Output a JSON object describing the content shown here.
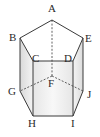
{
  "figure": {
    "type": "pentagonal-prism",
    "vertices": {
      "A": {
        "label": "A",
        "x": 52,
        "y": 20,
        "lx": 51,
        "ly": 14
      },
      "B": {
        "label": "B",
        "x": 20,
        "y": 38,
        "lx": 10,
        "ly": 42
      },
      "C": {
        "label": "C",
        "x": 33,
        "y": 61,
        "lx": 32,
        "ly": 58
      },
      "D": {
        "label": "D",
        "x": 73,
        "y": 61,
        "lx": 64,
        "ly": 58
      },
      "E": {
        "label": "E",
        "x": 83,
        "y": 38,
        "lx": 85,
        "ly": 42
      },
      "F": {
        "label": "F",
        "x": 52,
        "y": 76,
        "lx": 49,
        "ly": 87
      },
      "G": {
        "label": "G",
        "x": 20,
        "y": 91,
        "lx": 10,
        "ly": 95
      },
      "H": {
        "label": "H",
        "x": 33,
        "y": 116,
        "lx": 28,
        "ly": 127
      },
      "I": {
        "label": "I",
        "x": 73,
        "y": 116,
        "lx": 71,
        "ly": 127
      },
      "J": {
        "label": "J",
        "x": 83,
        "y": 91,
        "lx": 87,
        "ly": 97
      }
    },
    "visible_edges": [
      "AB",
      "BC",
      "CD",
      "DE",
      "EA",
      "BG",
      "GH",
      "HI",
      "IJ",
      "JE",
      "CH",
      "DI"
    ],
    "hidden_edges": [
      "AF",
      "FG",
      "FJ"
    ],
    "colors": {
      "edge": "#3a3a3a",
      "face_light": "#f2f2f2",
      "face_shade": "#e2e2e2"
    }
  }
}
